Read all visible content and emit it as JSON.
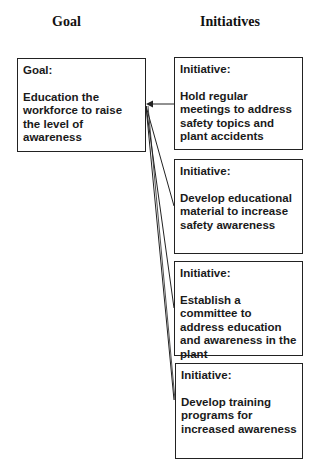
{
  "headers": {
    "goal": "Goal",
    "initiatives": "Initiatives"
  },
  "goal": {
    "label": "Goal:",
    "text": "Education the workforce to raise the level of awareness"
  },
  "initiatives": [
    {
      "label": "Initiative:",
      "text": "Hold regular meetings to address safety topics and plant accidents"
    },
    {
      "label": "Initiative:",
      "text": "Develop educational material to increase safety awareness"
    },
    {
      "label": "Initiative:",
      "text": "Establish a committee to address education and awareness in the plant"
    },
    {
      "label": "Initiative:",
      "text": "Develop training programs for increased awareness"
    }
  ]
}
